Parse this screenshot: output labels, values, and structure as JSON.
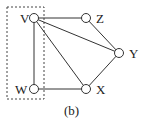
{
  "caption": "(b)",
  "nodes": [
    {
      "id": "V",
      "label": "V",
      "x": 34,
      "y": 18,
      "lx": 20,
      "ly": 12
    },
    {
      "id": "Z",
      "label": "Z",
      "x": 86,
      "y": 18,
      "lx": 96,
      "ly": 12
    },
    {
      "id": "Y",
      "label": "Y",
      "x": 119,
      "y": 53,
      "lx": 129,
      "ly": 47
    },
    {
      "id": "X",
      "label": "X",
      "x": 86,
      "y": 89,
      "lx": 96,
      "ly": 83
    },
    {
      "id": "W",
      "label": "W",
      "x": 34,
      "y": 89,
      "lx": 15,
      "ly": 83
    }
  ],
  "edges": [
    [
      "V",
      "Z"
    ],
    [
      "V",
      "Y"
    ],
    [
      "V",
      "X"
    ],
    [
      "V",
      "W"
    ],
    [
      "W",
      "X"
    ],
    [
      "X",
      "Y"
    ],
    [
      "Z",
      "Y"
    ]
  ],
  "group_box": {
    "x": 7,
    "y": 7,
    "w": 37,
    "h": 92,
    "members": [
      "V",
      "W"
    ]
  }
}
